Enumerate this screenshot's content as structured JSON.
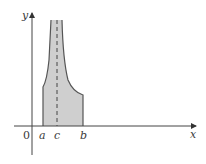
{
  "figure": {
    "axes": {
      "x_label": "x",
      "y_label": "y",
      "origin_label": "0"
    },
    "points": {
      "a": "a",
      "c": "c",
      "b": "b"
    },
    "colors": {
      "fill": "#cfcfcf",
      "stroke": "#555555",
      "axis": "#444444"
    }
  }
}
